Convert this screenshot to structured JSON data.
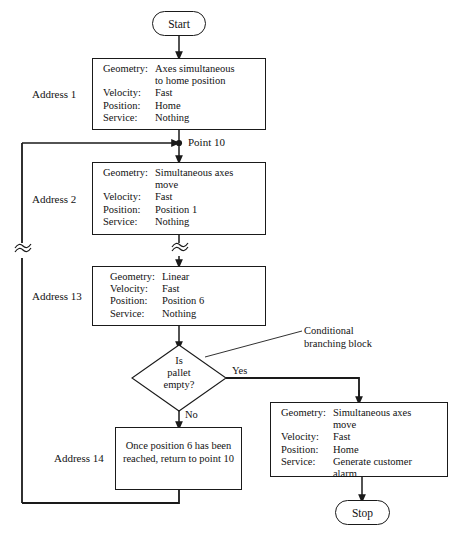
{
  "diagram": {
    "type": "flowchart",
    "line_color": "#1a1a1a",
    "background": "#ffffff"
  },
  "terminals": {
    "start": "Start",
    "stop": "Stop"
  },
  "junction": {
    "point10_label": "Point 10"
  },
  "annotation": {
    "conditional": "Conditional\nbranching block"
  },
  "decision": {
    "text": "Is\npallet\nempty?",
    "yes_label": "Yes",
    "no_label": "No"
  },
  "blocks": [
    {
      "address": "Address 1",
      "rows": [
        {
          "key": "Geometry:",
          "value": "Axes simultaneous\nto home position"
        },
        {
          "key": "Velocity:",
          "value": "Fast"
        },
        {
          "key": "Position:",
          "value": "Home"
        },
        {
          "key": "Service:",
          "value": "Nothing"
        }
      ]
    },
    {
      "address": "Address 2",
      "rows": [
        {
          "key": "Geometry:",
          "value": "Simultaneous axes\nmove"
        },
        {
          "key": "Velocity:",
          "value": "Fast"
        },
        {
          "key": "Position:",
          "value": "Position 1"
        },
        {
          "key": "Service:",
          "value": "Nothing"
        }
      ]
    },
    {
      "address": "Address 13",
      "rows": [
        {
          "key": "Geometry:",
          "value": "Linear"
        },
        {
          "key": "Velocity:",
          "value": "Fast"
        },
        {
          "key": "Position:",
          "value": "Position 6"
        },
        {
          "key": "Service:",
          "value": "Nothing"
        }
      ]
    },
    {
      "address": "Address 14",
      "text": "Once position 6\nhas been reached,\nreturn to point  10"
    },
    {
      "address": "",
      "rows": [
        {
          "key": "Geometry:",
          "value": "Simultaneous axes\nmove"
        },
        {
          "key": "Velocity:",
          "value": "Fast"
        },
        {
          "key": "Position:",
          "value": "Home"
        },
        {
          "key": "Service:",
          "value": "Generate customer\nalarm"
        }
      ]
    }
  ]
}
